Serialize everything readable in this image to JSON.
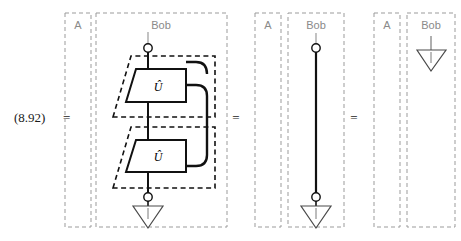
{
  "equation": {
    "number": "(8.92)",
    "equals_signs": [
      "=",
      "=",
      "="
    ]
  },
  "regions": {
    "alice_label": "A",
    "bob_label": "Bob"
  },
  "panels": [
    {
      "id": "panel-left",
      "alice_label": "A",
      "bob_label": "Bob",
      "gates": [
        {
          "label": "Û",
          "name": "unitary-gate-upper"
        },
        {
          "label": "Û",
          "name": "unitary-gate-lower"
        }
      ],
      "has_input_dot": true,
      "has_output_dot": true,
      "has_discard_triangle": true,
      "has_feedback_loop": true,
      "dashed_subregions": 2
    },
    {
      "id": "panel-middle",
      "alice_label": "A",
      "bob_label": "Bob",
      "gates": [],
      "has_input_dot": true,
      "has_output_dot": true,
      "has_discard_triangle": true,
      "has_feedback_loop": false,
      "dashed_subregions": 0
    },
    {
      "id": "panel-right",
      "alice_label": "A",
      "bob_label": "Bob",
      "gates": [],
      "has_input_dot": false,
      "has_output_dot": false,
      "has_discard_triangle": true,
      "has_feedback_loop": false,
      "dashed_subregions": 0
    }
  ],
  "colors": {
    "background": "#ffffff",
    "wire": "#111111",
    "dashed_region": "#9b9b9b",
    "dashed_subregion": "#111111",
    "gate_outline": "#111111",
    "gate_fill": "#ffffff",
    "label_text": "#8a8a8a",
    "equation_text": "#1a1a1a",
    "stub_wire": "#9a9a9a"
  }
}
